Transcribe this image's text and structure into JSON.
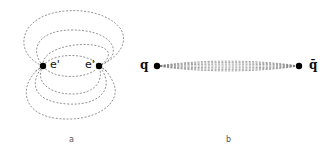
{
  "panel_a": {
    "caption": "a",
    "left_charge_label": "e'",
    "right_charge_label": "e'",
    "description": "dipole field lines between two point charges"
  },
  "panel_b": {
    "caption": "b",
    "left_charge_label": "q",
    "right_charge_label": "q̄",
    "description": "confined flux tube between quark and antiquark"
  },
  "colors": {
    "line": "#777777",
    "charge": "#000000",
    "background": "#ffffff"
  }
}
